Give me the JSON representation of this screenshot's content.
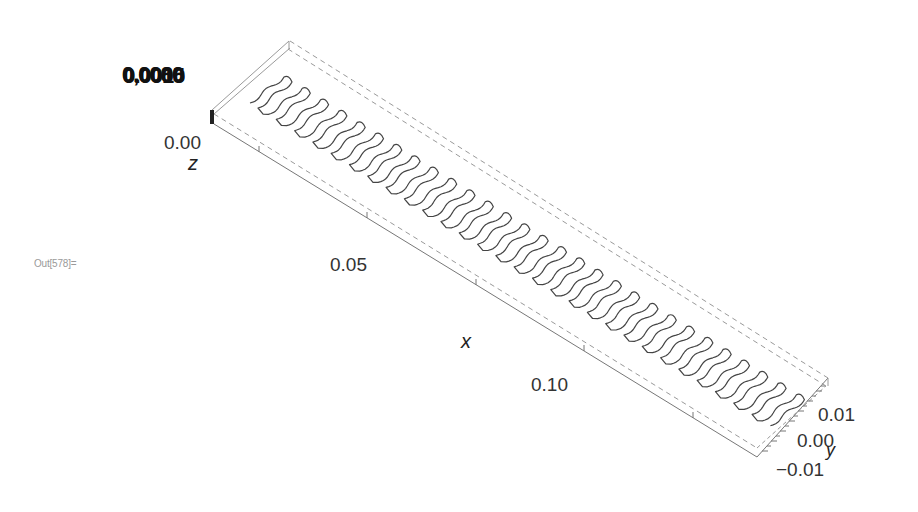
{
  "notebook": {
    "output_label": "Out[578]="
  },
  "chart_data": {
    "type": "line3d",
    "title": "",
    "axes": {
      "x": {
        "label": "x",
        "ticks": [
          "0.05",
          "0.10"
        ],
        "range": [
          0.0,
          0.13
        ]
      },
      "y": {
        "label": "y",
        "ticks": [
          "0.01",
          "0.00",
          "-0.01"
        ],
        "range": [
          -0.012,
          0.012
        ]
      },
      "z": {
        "label": "z",
        "ticks": [
          "0.00",
          "0.0000",
          "0.0005",
          "0.0010"
        ],
        "overlapping_ticks_text": "0,0080",
        "range": [
          0.0,
          0.001
        ]
      }
    },
    "box": {
      "visible": true,
      "back_edges_style": "dashed",
      "color": "#9a9a9a"
    },
    "series": [
      {
        "name": "meander",
        "loops": 29,
        "loop_pitch_x": 0.0043,
        "amplitude_y": 0.0105,
        "color": "#444444"
      }
    ]
  },
  "labels": {
    "z_overlap": "0,0080",
    "z_tick_0": "0.00",
    "z_axis": "z",
    "x_tick_1": "0.05",
    "x_tick_2": "0.10",
    "x_axis": "x",
    "y_tick_pos": "0.01",
    "y_tick_zero": "0.00",
    "y_tick_neg": "−0.01",
    "y_axis": "y"
  }
}
